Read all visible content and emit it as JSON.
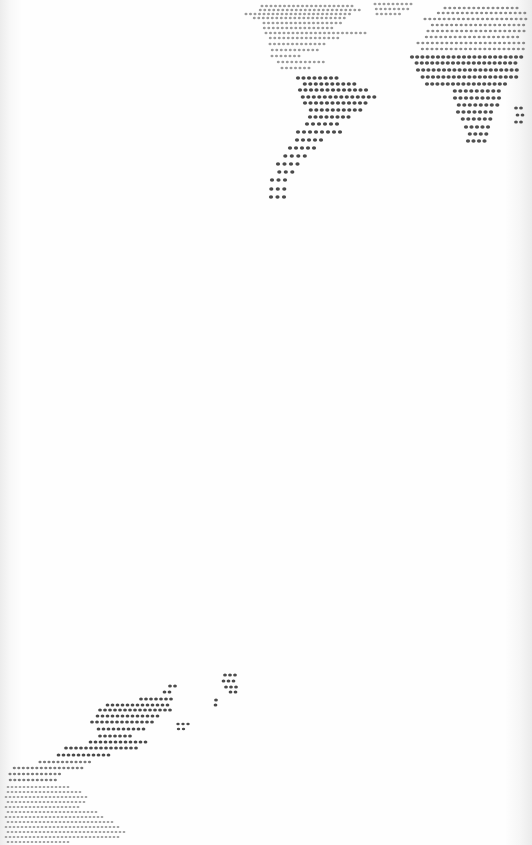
{
  "image": {
    "description": "Photograph of a white sheet printed with a dotted world map, viewed at an angle; continents rendered as grids of dark dots",
    "width": 532,
    "height": 845,
    "background_color": "#fdfdfd",
    "dot_color": "#3a3a3a",
    "faint_dot_color": "#9a9a9a"
  },
  "regions": [
    {
      "name": "north-america",
      "dot_size": 1.4,
      "color": "#9a9a9a",
      "rows": [
        {
          "y": 6,
          "x0": 262,
          "x1": 355,
          "step": 4.5
        },
        {
          "y": 10,
          "x0": 258,
          "x1": 360,
          "step": 4.5
        },
        {
          "y": 14,
          "x0": 246,
          "x1": 350,
          "step": 4.5
        },
        {
          "y": 18,
          "x0": 252,
          "x1": 345,
          "step": 4.5
        },
        {
          "y": 23,
          "x0": 264,
          "x1": 343,
          "step": 4.5
        },
        {
          "y": 28,
          "x0": 262,
          "x1": 335,
          "step": 4.5
        },
        {
          "y": 33,
          "x0": 266,
          "x1": 368,
          "step": 4.5
        },
        {
          "y": 38,
          "x0": 268,
          "x1": 338,
          "step": 4.5
        },
        {
          "y": 44,
          "x0": 270,
          "x1": 325,
          "step": 4.5
        },
        {
          "y": 50,
          "x0": 270,
          "x1": 318,
          "step": 4.5
        },
        {
          "y": 56,
          "x0": 272,
          "x1": 300,
          "step": 4.5
        },
        {
          "y": 62,
          "x0": 276,
          "x1": 325,
          "step": 4.5
        },
        {
          "y": 68,
          "x0": 282,
          "x1": 310,
          "step": 4.5
        }
      ]
    },
    {
      "name": "greenland",
      "dot_size": 1.4,
      "color": "#9a9a9a",
      "rows": [
        {
          "y": 4,
          "x0": 375,
          "x1": 412,
          "step": 4.5
        },
        {
          "y": 9,
          "x0": 374,
          "x1": 410,
          "step": 4.5
        },
        {
          "y": 14,
          "x0": 377,
          "x1": 400,
          "step": 4.5
        }
      ]
    },
    {
      "name": "south-america",
      "dot_size": 2.0,
      "color": "#4a4a4a",
      "rows": [
        {
          "y": 78,
          "x0": 298,
          "x1": 340,
          "step": 5.5
        },
        {
          "y": 84,
          "x0": 302,
          "x1": 355,
          "step": 5.5
        },
        {
          "y": 90,
          "x0": 300,
          "x1": 368,
          "step": 5.5
        },
        {
          "y": 97,
          "x0": 300,
          "x1": 375,
          "step": 5.5
        },
        {
          "y": 103,
          "x0": 305,
          "x1": 370,
          "step": 5.5
        },
        {
          "y": 110,
          "x0": 308,
          "x1": 362,
          "step": 5.5
        },
        {
          "y": 117,
          "x0": 310,
          "x1": 352,
          "step": 5.5
        },
        {
          "y": 124,
          "x0": 304,
          "x1": 340,
          "step": 6
        },
        {
          "y": 132,
          "x0": 298,
          "x1": 340,
          "step": 6
        },
        {
          "y": 140,
          "x0": 294,
          "x1": 325,
          "step": 6
        },
        {
          "y": 148,
          "x0": 290,
          "x1": 318,
          "step": 6
        },
        {
          "y": 156,
          "x0": 282,
          "x1": 310,
          "step": 6.5
        },
        {
          "y": 164,
          "x0": 278,
          "x1": 302,
          "step": 6.5
        },
        {
          "y": 172,
          "x0": 276,
          "x1": 294,
          "step": 6.5
        },
        {
          "y": 180,
          "x0": 272,
          "x1": 286,
          "step": 6.5
        },
        {
          "y": 189,
          "x0": 268,
          "x1": 286,
          "step": 6.5
        },
        {
          "y": 197,
          "x0": 271,
          "x1": 290,
          "step": 6.5
        }
      ]
    },
    {
      "name": "europe",
      "dot_size": 1.5,
      "color": "#8a8a8a",
      "rows": [
        {
          "y": 8,
          "x0": 445,
          "x1": 520,
          "step": 4.8
        },
        {
          "y": 13,
          "x0": 436,
          "x1": 528,
          "step": 4.8
        },
        {
          "y": 19,
          "x0": 425,
          "x1": 528,
          "step": 4.8
        },
        {
          "y": 25,
          "x0": 430,
          "x1": 528,
          "step": 4.8
        },
        {
          "y": 31,
          "x0": 428,
          "x1": 528,
          "step": 4.8
        },
        {
          "y": 37,
          "x0": 424,
          "x1": 520,
          "step": 4.8
        },
        {
          "y": 43,
          "x0": 418,
          "x1": 528,
          "step": 4.8
        },
        {
          "y": 49,
          "x0": 420,
          "x1": 525,
          "step": 4.8
        }
      ]
    },
    {
      "name": "africa",
      "dot_size": 2.0,
      "color": "#505050",
      "rows": [
        {
          "y": 57,
          "x0": 412,
          "x1": 525,
          "step": 5.2
        },
        {
          "y": 63,
          "x0": 414,
          "x1": 518,
          "step": 5.2
        },
        {
          "y": 70,
          "x0": 418,
          "x1": 520,
          "step": 5.2
        },
        {
          "y": 77,
          "x0": 420,
          "x1": 518,
          "step": 5.2
        },
        {
          "y": 84,
          "x0": 427,
          "x1": 505,
          "step": 5.2
        },
        {
          "y": 91,
          "x0": 452,
          "x1": 502,
          "step": 5.5
        },
        {
          "y": 98,
          "x0": 455,
          "x1": 500,
          "step": 5.5
        },
        {
          "y": 105,
          "x0": 456,
          "x1": 498,
          "step": 5.5
        },
        {
          "y": 112,
          "x0": 458,
          "x1": 496,
          "step": 5.5
        },
        {
          "y": 119,
          "x0": 460,
          "x1": 494,
          "step": 5.5
        },
        {
          "y": 127,
          "x0": 466,
          "x1": 492,
          "step": 5.5
        },
        {
          "y": 134,
          "x0": 467,
          "x1": 489,
          "step": 5.5
        },
        {
          "y": 141,
          "x0": 468,
          "x1": 486,
          "step": 5.5
        }
      ]
    },
    {
      "name": "madagascar",
      "dot_size": 1.8,
      "color": "#505050",
      "rows": [
        {
          "y": 108,
          "x0": 516,
          "x1": 525,
          "step": 5
        },
        {
          "y": 115,
          "x0": 515,
          "x1": 523,
          "step": 5
        },
        {
          "y": 122,
          "x0": 516,
          "x1": 522,
          "step": 5
        }
      ]
    },
    {
      "name": "asia-china",
      "dot_size": 1.8,
      "color": "#4a4a4a",
      "rows": [
        {
          "y": 686,
          "x0": 170,
          "x1": 176,
          "step": 5
        },
        {
          "y": 692,
          "x0": 162,
          "x1": 174,
          "step": 5
        },
        {
          "y": 699,
          "x0": 141,
          "x1": 172,
          "step": 5
        },
        {
          "y": 705,
          "x0": 105,
          "x1": 168,
          "step": 5
        },
        {
          "y": 710,
          "x0": 100,
          "x1": 172,
          "step": 5
        },
        {
          "y": 716,
          "x0": 95,
          "x1": 160,
          "step": 5
        },
        {
          "y": 722,
          "x0": 92,
          "x1": 155,
          "step": 5
        },
        {
          "y": 729,
          "x0": 96,
          "x1": 145,
          "step": 5
        },
        {
          "y": 736,
          "x0": 100,
          "x1": 130,
          "step": 5
        },
        {
          "y": 742,
          "x0": 88,
          "x1": 150,
          "step": 5
        },
        {
          "y": 748,
          "x0": 66,
          "x1": 140,
          "step": 5
        },
        {
          "y": 755,
          "x0": 56,
          "x1": 110,
          "step": 5
        }
      ]
    },
    {
      "name": "japan",
      "dot_size": 1.8,
      "color": "#4a4a4a",
      "rows": [
        {
          "y": 675,
          "x0": 225,
          "x1": 235,
          "step": 5
        },
        {
          "y": 681,
          "x0": 221,
          "x1": 234,
          "step": 5
        },
        {
          "y": 687,
          "x0": 226,
          "x1": 236,
          "step": 5
        },
        {
          "y": 692,
          "x0": 228,
          "x1": 238,
          "step": 5
        },
        {
          "y": 700,
          "x0": 216,
          "x1": 220,
          "step": 5
        },
        {
          "y": 705,
          "x0": 213,
          "x1": 217,
          "step": 5
        }
      ]
    },
    {
      "name": "korea",
      "dot_size": 1.6,
      "color": "#4a4a4a",
      "rows": [
        {
          "y": 724,
          "x0": 178,
          "x1": 188,
          "step": 5
        },
        {
          "y": 729,
          "x0": 176,
          "x1": 186,
          "step": 5
        }
      ]
    },
    {
      "name": "southeast-asia",
      "dot_size": 1.5,
      "color": "#7a7a7a",
      "rows": [
        {
          "y": 762,
          "x0": 40,
          "x1": 92,
          "step": 4.5
        },
        {
          "y": 768,
          "x0": 12,
          "x1": 86,
          "step": 4.5
        },
        {
          "y": 774,
          "x0": 10,
          "x1": 60,
          "step": 4.5
        },
        {
          "y": 780,
          "x0": 8,
          "x1": 56,
          "step": 4.5
        }
      ]
    },
    {
      "name": "australia",
      "dot_size": 1.3,
      "color": "#9a9a9a",
      "rows": [
        {
          "y": 787,
          "x0": 8,
          "x1": 70,
          "step": 4
        },
        {
          "y": 792,
          "x0": 6,
          "x1": 82,
          "step": 4
        },
        {
          "y": 797,
          "x0": 6,
          "x1": 88,
          "step": 4
        },
        {
          "y": 802,
          "x0": 6,
          "x1": 86,
          "step": 4
        },
        {
          "y": 807,
          "x0": 6,
          "x1": 80,
          "step": 4
        },
        {
          "y": 812,
          "x0": 6,
          "x1": 96,
          "step": 4
        },
        {
          "y": 817,
          "x0": 6,
          "x1": 104,
          "step": 4
        },
        {
          "y": 822,
          "x0": 6,
          "x1": 112,
          "step": 4
        },
        {
          "y": 827,
          "x0": 6,
          "x1": 118,
          "step": 4
        },
        {
          "y": 832,
          "x0": 6,
          "x1": 124,
          "step": 4
        },
        {
          "y": 837,
          "x0": 6,
          "x1": 120,
          "step": 4
        },
        {
          "y": 842,
          "x0": 6,
          "x1": 70,
          "step": 4
        }
      ]
    }
  ]
}
